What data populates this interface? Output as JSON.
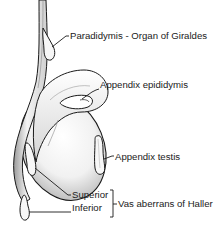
{
  "diagram": {
    "labels": {
      "paradidymis": "Paradidymis - Organ of Giraldes",
      "appendix_epididymis": "Appendix epididymis",
      "appendix_testis": "Appendix testis",
      "superior": "Superior",
      "inferior": "Inferior",
      "vas_aberrans": "Vas aberrans of Haller"
    },
    "colors": {
      "outline": "#1a1a1a",
      "fill": "#f4f4f4",
      "shade": "#bdbdbd",
      "background": "#ffffff"
    }
  }
}
